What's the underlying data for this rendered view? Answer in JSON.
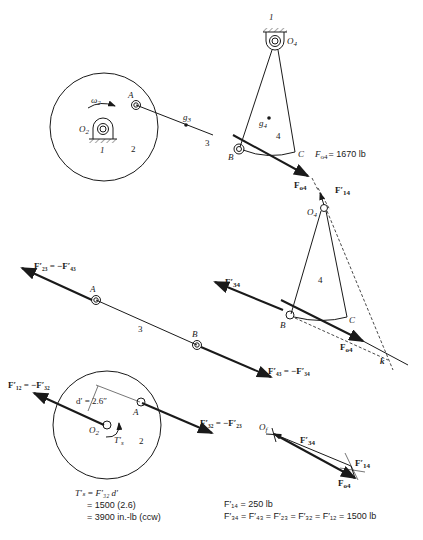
{
  "top_linkage": {
    "ground_label_top": "1",
    "ground_label_crank": "1",
    "pivot_O2": "O",
    "pivot_O2_sub": "2",
    "pivot_O4": "O",
    "pivot_O4_sub": "4",
    "omega": "ω",
    "omega_sub": "2",
    "point_A": "A",
    "point_B": "B",
    "point_C": "C",
    "g3": "g",
    "g3_sub": "3",
    "g4": "g",
    "g4_sub": "4",
    "link_2": "2",
    "link_3": "3",
    "link_4": "4",
    "force_label": "F",
    "force_sub": "o4",
    "force_value_label": "F",
    "force_value_sub": "o4",
    "force_value": "= 1670 lb"
  },
  "link4_fbd": {
    "pivot_label": "O",
    "pivot_sub": "4",
    "F14": "F′",
    "F14_sub": "14",
    "F34": "F′",
    "F34_sub": "34",
    "link_4": "4",
    "point_B": "B",
    "point_C": "C",
    "Fo4": "F",
    "Fo4_sub": "o4",
    "point_k": "k"
  },
  "link3_fbd": {
    "F23_eq": "F′₂₃ = −F′₄₃",
    "F43_eq": "F′₄₃ = −F′₃₄",
    "point_A": "A",
    "point_B": "B",
    "link_3": "3"
  },
  "link2_fbd": {
    "F12_eq": "F′₁₂ = −F′₃₂",
    "F32_eq": "F′₃₂ = −F′₂₃",
    "d_label": "d′ = 2.6″",
    "point_A": "A",
    "pivot": "O",
    "pivot_sub": "2",
    "torque": "T′",
    "torque_sub": "s",
    "link_2": "2",
    "calc_line1": "T′ₛ = F′₃₂ d′",
    "calc_line2": "= 1500 (2.6)",
    "calc_line3": "= 3900 in.-lb (ccw)"
  },
  "force_polygon": {
    "origin": "O",
    "origin_sub": "f",
    "F34": "F′",
    "F34_sub": "34",
    "F14": "F′",
    "F14_sub": "14",
    "Fo4": "F",
    "Fo4_sub": "o4",
    "result_line1": "F′₁₄ = 250 lb",
    "result_line2": "F′₃₄ = F′₄₃ = F′₂₃ = F′₃₂ = F′₁₂ = 1500 lb"
  }
}
